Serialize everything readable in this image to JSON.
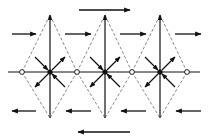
{
  "diagram": {
    "width": 212,
    "height": 138,
    "colors": {
      "solid": "#111111",
      "dashed": "#888888",
      "background": "#ffffff",
      "open_node_fill": "#ffffff"
    },
    "center_y": 72,
    "top_y": 15,
    "bottom_y": 118,
    "filled_nodes": [
      {
        "x": 50,
        "y": 72
      },
      {
        "x": 105,
        "y": 72
      },
      {
        "x": 160,
        "y": 72
      }
    ],
    "open_nodes": [
      {
        "x": 22,
        "y": 72
      },
      {
        "x": 77,
        "y": 72
      },
      {
        "x": 132,
        "y": 72
      },
      {
        "x": 187,
        "y": 72
      }
    ],
    "horizontal_axis": {
      "x1": 8,
      "x2": 200,
      "y": 72
    },
    "vertical_lines": [
      {
        "x": 50,
        "y1": 118,
        "y2": 15,
        "arrow": "up"
      },
      {
        "x": 105,
        "y1": 118,
        "y2": 15,
        "arrow": "up"
      },
      {
        "x": 160,
        "y1": 118,
        "y2": 15,
        "arrow": "up"
      }
    ],
    "flow_arrows_right": [
      {
        "x1": 79,
        "x2": 130,
        "y": 10,
        "label": "top-flow"
      },
      {
        "x1": 12,
        "x2": 36,
        "y": 34
      },
      {
        "x1": 65,
        "x2": 91,
        "y": 34
      },
      {
        "x1": 120,
        "x2": 146,
        "y": 34
      },
      {
        "x1": 175,
        "x2": 201,
        "y": 34
      }
    ],
    "flow_arrows_left": [
      {
        "x1": 36,
        "x2": 12,
        "y": 111
      },
      {
        "x1": 91,
        "x2": 66,
        "y": 111
      },
      {
        "x1": 146,
        "x2": 121,
        "y": 111
      },
      {
        "x1": 201,
        "x2": 176,
        "y": 111
      },
      {
        "x1": 130,
        "x2": 78,
        "y": 132,
        "label": "bottom-flow"
      }
    ],
    "diag_arrow_offset": 15
  }
}
